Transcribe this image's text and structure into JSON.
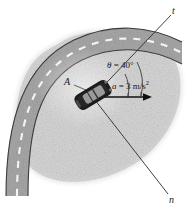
{
  "figure": {
    "labels": {
      "tangential_axis": "t",
      "normal_axis": "n",
      "point": "A",
      "theta_symbol": "θ",
      "theta_equals": " = 40°",
      "accel_symbol": "a",
      "accel_equals": " = 3 m/s",
      "accel_exponent": "2"
    },
    "values": {
      "theta_degrees": 40,
      "acceleration": 3,
      "acceleration_units": "m/s²"
    },
    "colors": {
      "background": "#ffffff",
      "terrain": "#d6d6d6",
      "road": "#a9a9a9",
      "road_edge": "#3b3b3b",
      "lane_dash": "#f4f4f4",
      "car_body": "#1c1c1c",
      "car_window": "#8f8f8f",
      "axis_line": "#2b2b2b",
      "text": "#1a1a1a"
    },
    "elements": {
      "terrain_blob": "speckled-gray-terrain",
      "road_band": "curved-two-lane-road",
      "center_dashes": "dashed-lane-divider",
      "car": "car-top-view",
      "arc": "angle-arc",
      "accel_arrow": "acceleration-arrow"
    }
  }
}
